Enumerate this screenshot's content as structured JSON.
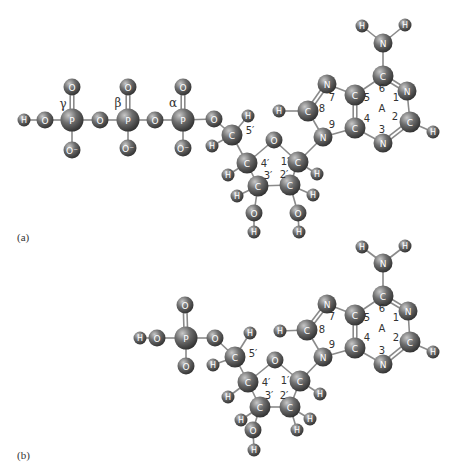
{
  "figure": {
    "colors": {
      "atom_light": "#b8b8b8",
      "atom_dark": "#3a3a3a",
      "bond": "#8a8a8a",
      "text": "#333333"
    },
    "panels": [
      {
        "id": "a",
        "label": "(a)",
        "label_pos": [
          17,
          241
        ],
        "greek_labels": [
          {
            "text": "γ",
            "x": 63,
            "y": 104
          },
          {
            "text": "β",
            "x": 118,
            "y": 103
          },
          {
            "text": "α",
            "x": 173,
            "y": 103
          }
        ],
        "atoms": [
          {
            "id": "Hpg",
            "el": "H",
            "x": 24,
            "y": 120
          },
          {
            "id": "Og1",
            "el": "O",
            "x": 45,
            "y": 120
          },
          {
            "id": "Pg",
            "el": "P",
            "x": 72,
            "y": 120
          },
          {
            "id": "Og2",
            "el": "O",
            "x": 72,
            "y": 87
          },
          {
            "id": "Og3",
            "el": "O⁻",
            "x": 72,
            "y": 150
          },
          {
            "id": "Ogb",
            "el": "O",
            "x": 100,
            "y": 120
          },
          {
            "id": "Pb",
            "el": "P",
            "x": 128,
            "y": 120
          },
          {
            "id": "Ob2",
            "el": "O",
            "x": 128,
            "y": 87
          },
          {
            "id": "Ob3",
            "el": "O⁻",
            "x": 128,
            "y": 148
          },
          {
            "id": "Oba",
            "el": "O",
            "x": 155,
            "y": 120
          },
          {
            "id": "Pa",
            "el": "P",
            "x": 183,
            "y": 120
          },
          {
            "id": "Oa2",
            "el": "O",
            "x": 183,
            "y": 87
          },
          {
            "id": "Oa3",
            "el": "O⁻",
            "x": 183,
            "y": 148
          },
          {
            "id": "O5",
            "el": "O",
            "x": 214,
            "y": 119
          },
          {
            "id": "C5",
            "el": "C",
            "x": 232,
            "y": 135
          },
          {
            "id": "H5a",
            "el": "H",
            "x": 248,
            "y": 116
          },
          {
            "id": "H5b",
            "el": "H",
            "x": 212,
            "y": 146
          },
          {
            "id": "O4",
            "el": "O",
            "x": 274,
            "y": 140
          },
          {
            "id": "C4p",
            "el": "C",
            "x": 247,
            "y": 163
          },
          {
            "id": "H4p",
            "el": "H",
            "x": 228,
            "y": 175
          },
          {
            "id": "C1p",
            "el": "C",
            "x": 298,
            "y": 162
          },
          {
            "id": "H1p",
            "el": "H",
            "x": 317,
            "y": 174
          },
          {
            "id": "C3p",
            "el": "C",
            "x": 258,
            "y": 186
          },
          {
            "id": "H3p",
            "el": "H",
            "x": 237,
            "y": 196
          },
          {
            "id": "C2p",
            "el": "C",
            "x": 290,
            "y": 185
          },
          {
            "id": "H2p",
            "el": "H",
            "x": 313,
            "y": 195
          },
          {
            "id": "O3p",
            "el": "O",
            "x": 254,
            "y": 213
          },
          {
            "id": "HO3",
            "el": "H",
            "x": 254,
            "y": 232
          },
          {
            "id": "O2p",
            "el": "O",
            "x": 298,
            "y": 213
          },
          {
            "id": "HO2",
            "el": "H",
            "x": 299,
            "y": 232
          },
          {
            "id": "N9",
            "el": "N",
            "x": 323,
            "y": 137
          },
          {
            "id": "C8",
            "el": "C",
            "x": 308,
            "y": 111
          },
          {
            "id": "H8",
            "el": "H",
            "x": 279,
            "y": 111
          },
          {
            "id": "N7",
            "el": "N",
            "x": 327,
            "y": 84
          },
          {
            "id": "C5b",
            "el": "C",
            "x": 355,
            "y": 95
          },
          {
            "id": "C4b",
            "el": "C",
            "x": 355,
            "y": 128
          },
          {
            "id": "N3",
            "el": "N",
            "x": 383,
            "y": 143
          },
          {
            "id": "C2",
            "el": "C",
            "x": 410,
            "y": 122
          },
          {
            "id": "H2",
            "el": "H",
            "x": 433,
            "y": 132
          },
          {
            "id": "N1",
            "el": "N",
            "x": 407,
            "y": 91
          },
          {
            "id": "C6",
            "el": "C",
            "x": 383,
            "y": 76
          },
          {
            "id": "N6",
            "el": "N",
            "x": 383,
            "y": 43
          },
          {
            "id": "H6a",
            "el": "H",
            "x": 362,
            "y": 26
          },
          {
            "id": "H6b",
            "el": "H",
            "x": 405,
            "y": 25
          }
        ],
        "bonds": [
          [
            "Hpg",
            "Og1",
            1
          ],
          [
            "Og1",
            "Pg",
            1
          ],
          [
            "Pg",
            "Og2",
            2
          ],
          [
            "Pg",
            "Og3",
            1
          ],
          [
            "Pg",
            "Ogb",
            1
          ],
          [
            "Ogb",
            "Pb",
            1
          ],
          [
            "Pb",
            "Ob2",
            2
          ],
          [
            "Pb",
            "Ob3",
            1
          ],
          [
            "Pb",
            "Oba",
            1
          ],
          [
            "Oba",
            "Pa",
            1
          ],
          [
            "Pa",
            "Oa2",
            2
          ],
          [
            "Pa",
            "Oa3",
            1
          ],
          [
            "Pa",
            "O5",
            1
          ],
          [
            "O5",
            "C5",
            1
          ],
          [
            "C5",
            "H5a",
            1
          ],
          [
            "C5",
            "H5b",
            1
          ],
          [
            "C5",
            "C4p",
            1
          ],
          [
            "C4p",
            "O4",
            1
          ],
          [
            "O4",
            "C1p",
            1
          ],
          [
            "C4p",
            "H4p",
            1
          ],
          [
            "C4p",
            "C3p",
            1
          ],
          [
            "C3p",
            "C2p",
            1
          ],
          [
            "C2p",
            "C1p",
            1
          ],
          [
            "C1p",
            "H1p",
            1
          ],
          [
            "C3p",
            "H3p",
            1
          ],
          [
            "C2p",
            "H2p",
            1
          ],
          [
            "C3p",
            "O3p",
            1
          ],
          [
            "O3p",
            "HO3",
            1
          ],
          [
            "C2p",
            "O2p",
            1
          ],
          [
            "O2p",
            "HO2",
            1
          ],
          [
            "C1p",
            "N9",
            1
          ],
          [
            "N9",
            "C8",
            1
          ],
          [
            "C8",
            "H8",
            1
          ],
          [
            "C8",
            "N7",
            2
          ],
          [
            "N7",
            "C5b",
            1
          ],
          [
            "C5b",
            "C4b",
            2
          ],
          [
            "C4b",
            "N9",
            1
          ],
          [
            "C4b",
            "N3",
            1
          ],
          [
            "N3",
            "C2",
            2
          ],
          [
            "C2",
            "H2",
            1
          ],
          [
            "C2",
            "N1",
            1
          ],
          [
            "N1",
            "C6",
            2
          ],
          [
            "C6",
            "C5b",
            1
          ],
          [
            "C6",
            "N6",
            1
          ],
          [
            "N6",
            "H6a",
            1
          ],
          [
            "N6",
            "H6b",
            1
          ]
        ],
        "numbers": [
          {
            "text": "5′",
            "x": 250,
            "y": 130
          },
          {
            "text": "4′",
            "x": 265,
            "y": 163
          },
          {
            "text": "1′",
            "x": 285,
            "y": 161
          },
          {
            "text": "3′",
            "x": 268,
            "y": 175
          },
          {
            "text": "2′",
            "x": 284,
            "y": 174
          },
          {
            "text": "7",
            "x": 332,
            "y": 97
          },
          {
            "text": "8",
            "x": 322,
            "y": 108
          },
          {
            "text": "9",
            "x": 332,
            "y": 124
          },
          {
            "text": "5",
            "x": 367,
            "y": 97
          },
          {
            "text": "4",
            "x": 367,
            "y": 118
          },
          {
            "text": "6",
            "x": 382,
            "y": 88
          },
          {
            "text": "1",
            "x": 396,
            "y": 97
          },
          {
            "text": "A",
            "x": 382,
            "y": 108
          },
          {
            "text": "2",
            "x": 395,
            "y": 116
          },
          {
            "text": "3",
            "x": 382,
            "y": 129
          }
        ]
      },
      {
        "id": "b",
        "label": "(b)",
        "label_pos": [
          17,
          459
        ],
        "greek_labels": [],
        "atoms": [
          {
            "id": "Hp",
            "el": "H",
            "x": 140,
            "y": 338
          },
          {
            "id": "Op1",
            "el": "O",
            "x": 157,
            "y": 338
          },
          {
            "id": "P",
            "el": "P",
            "x": 186,
            "y": 338
          },
          {
            "id": "Op2",
            "el": "O",
            "x": 185,
            "y": 305
          },
          {
            "id": "Op3",
            "el": "O",
            "x": 186,
            "y": 366
          },
          {
            "id": "O5",
            "el": "O",
            "x": 215,
            "y": 338
          },
          {
            "id": "C5",
            "el": "C",
            "x": 235,
            "y": 357
          },
          {
            "id": "H5a",
            "el": "H",
            "x": 250,
            "y": 333
          },
          {
            "id": "H5b",
            "el": "H",
            "x": 213,
            "y": 365
          },
          {
            "id": "O4",
            "el": "O",
            "x": 275,
            "y": 360
          },
          {
            "id": "C4p",
            "el": "C",
            "x": 248,
            "y": 382
          },
          {
            "id": "H4p",
            "el": "H",
            "x": 228,
            "y": 397
          },
          {
            "id": "C1p",
            "el": "C",
            "x": 300,
            "y": 381
          },
          {
            "id": "H1p",
            "el": "H",
            "x": 320,
            "y": 394
          },
          {
            "id": "C3p",
            "el": "C",
            "x": 260,
            "y": 407
          },
          {
            "id": "H3p",
            "el": "H",
            "x": 241,
            "y": 420
          },
          {
            "id": "C2p",
            "el": "C",
            "x": 290,
            "y": 407
          },
          {
            "id": "H2a",
            "el": "H",
            "x": 310,
            "y": 419
          },
          {
            "id": "H2b",
            "el": "H",
            "x": 297,
            "y": 430
          },
          {
            "id": "O3p",
            "el": "O",
            "x": 253,
            "y": 430
          },
          {
            "id": "HO3",
            "el": "H",
            "x": 254,
            "y": 450
          },
          {
            "id": "N9",
            "el": "N",
            "x": 323,
            "y": 357
          },
          {
            "id": "C8",
            "el": "C",
            "x": 307,
            "y": 330
          },
          {
            "id": "H8",
            "el": "H",
            "x": 280,
            "y": 331
          },
          {
            "id": "N7",
            "el": "N",
            "x": 327,
            "y": 304
          },
          {
            "id": "C5b",
            "el": "C",
            "x": 355,
            "y": 315
          },
          {
            "id": "C4b",
            "el": "C",
            "x": 355,
            "y": 348
          },
          {
            "id": "N3",
            "el": "N",
            "x": 383,
            "y": 364
          },
          {
            "id": "C2",
            "el": "C",
            "x": 410,
            "y": 342
          },
          {
            "id": "H2",
            "el": "H",
            "x": 433,
            "y": 352
          },
          {
            "id": "N1",
            "el": "N",
            "x": 408,
            "y": 311
          },
          {
            "id": "C6",
            "el": "C",
            "x": 383,
            "y": 296
          },
          {
            "id": "N6",
            "el": "N",
            "x": 383,
            "y": 263
          },
          {
            "id": "H6a",
            "el": "H",
            "x": 362,
            "y": 247
          },
          {
            "id": "H6b",
            "el": "H",
            "x": 405,
            "y": 246
          }
        ],
        "bonds": [
          [
            "Hp",
            "Op1",
            1
          ],
          [
            "Op1",
            "P",
            1
          ],
          [
            "P",
            "Op2",
            2
          ],
          [
            "P",
            "Op3",
            1
          ],
          [
            "P",
            "O5",
            1
          ],
          [
            "O5",
            "C5",
            1
          ],
          [
            "C5",
            "H5a",
            1
          ],
          [
            "C5",
            "H5b",
            1
          ],
          [
            "C5",
            "C4p",
            1
          ],
          [
            "C4p",
            "O4",
            1
          ],
          [
            "O4",
            "C1p",
            1
          ],
          [
            "C4p",
            "H4p",
            1
          ],
          [
            "C4p",
            "C3p",
            1
          ],
          [
            "C3p",
            "C2p",
            1
          ],
          [
            "C2p",
            "C1p",
            1
          ],
          [
            "C1p",
            "H1p",
            1
          ],
          [
            "C3p",
            "H3p",
            1
          ],
          [
            "C2p",
            "H2a",
            1
          ],
          [
            "C2p",
            "H2b",
            1
          ],
          [
            "C3p",
            "O3p",
            1
          ],
          [
            "O3p",
            "HO3",
            1
          ],
          [
            "C1p",
            "N9",
            1
          ],
          [
            "N9",
            "C8",
            1
          ],
          [
            "C8",
            "H8",
            1
          ],
          [
            "C8",
            "N7",
            2
          ],
          [
            "N7",
            "C5b",
            1
          ],
          [
            "C5b",
            "C4b",
            2
          ],
          [
            "C4b",
            "N9",
            1
          ],
          [
            "C4b",
            "N3",
            1
          ],
          [
            "N3",
            "C2",
            2
          ],
          [
            "C2",
            "H2",
            1
          ],
          [
            "C2",
            "N1",
            1
          ],
          [
            "N1",
            "C6",
            2
          ],
          [
            "C6",
            "C5b",
            1
          ],
          [
            "C6",
            "N6",
            1
          ],
          [
            "N6",
            "H6a",
            1
          ],
          [
            "N6",
            "H6b",
            1
          ]
        ],
        "numbers": [
          {
            "text": "5′",
            "x": 253,
            "y": 353
          },
          {
            "text": "4′",
            "x": 266,
            "y": 382
          },
          {
            "text": "1′",
            "x": 285,
            "y": 380
          },
          {
            "text": "3′",
            "x": 269,
            "y": 395
          },
          {
            "text": "2′",
            "x": 284,
            "y": 395
          },
          {
            "text": "7",
            "x": 332,
            "y": 316
          },
          {
            "text": "8",
            "x": 322,
            "y": 329
          },
          {
            "text": "9",
            "x": 332,
            "y": 344
          },
          {
            "text": "5",
            "x": 367,
            "y": 317
          },
          {
            "text": "4",
            "x": 367,
            "y": 337
          },
          {
            "text": "6",
            "x": 382,
            "y": 308
          },
          {
            "text": "1",
            "x": 396,
            "y": 317
          },
          {
            "text": "A",
            "x": 382,
            "y": 328
          },
          {
            "text": "2",
            "x": 396,
            "y": 337
          },
          {
            "text": "3",
            "x": 382,
            "y": 350
          }
        ]
      }
    ]
  }
}
